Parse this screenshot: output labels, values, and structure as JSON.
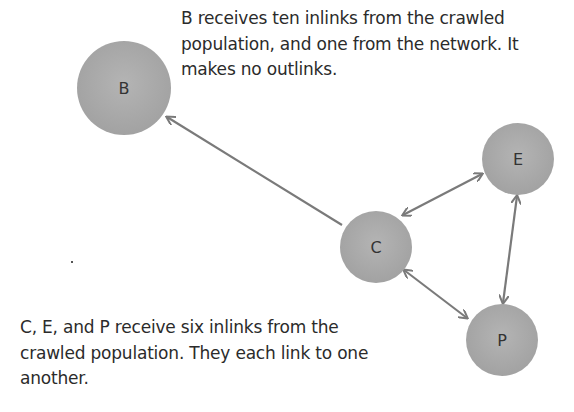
{
  "diagram": {
    "captions": {
      "top": {
        "lines": [
          "B receives ten inlinks from the crawled",
          "population, and one from the network. It",
          "makes no outlinks."
        ]
      },
      "bottom": {
        "lines": [
          "C, E, and P receive six inlinks from the",
          "crawled population. They each link to one",
          "another."
        ]
      }
    },
    "nodes": [
      {
        "id": "B",
        "label": "B",
        "cx": 124,
        "cy": 88,
        "r": 47
      },
      {
        "id": "C",
        "label": "C",
        "cx": 376,
        "cy": 247,
        "r": 36
      },
      {
        "id": "E",
        "label": "E",
        "cx": 518,
        "cy": 159,
        "r": 36
      },
      {
        "id": "P",
        "label": "P",
        "cx": 502,
        "cy": 340,
        "r": 36
      }
    ],
    "edges": [
      {
        "from": "C",
        "to": "B",
        "direction": "one-way"
      },
      {
        "from": "C",
        "to": "E",
        "direction": "two-way"
      },
      {
        "from": "C",
        "to": "P",
        "direction": "two-way"
      },
      {
        "from": "E",
        "to": "P",
        "direction": "two-way"
      }
    ],
    "colors": {
      "node_fill": "#aaaaaa",
      "edge": "#7a7a7a",
      "text": "#2b2b2b"
    }
  }
}
